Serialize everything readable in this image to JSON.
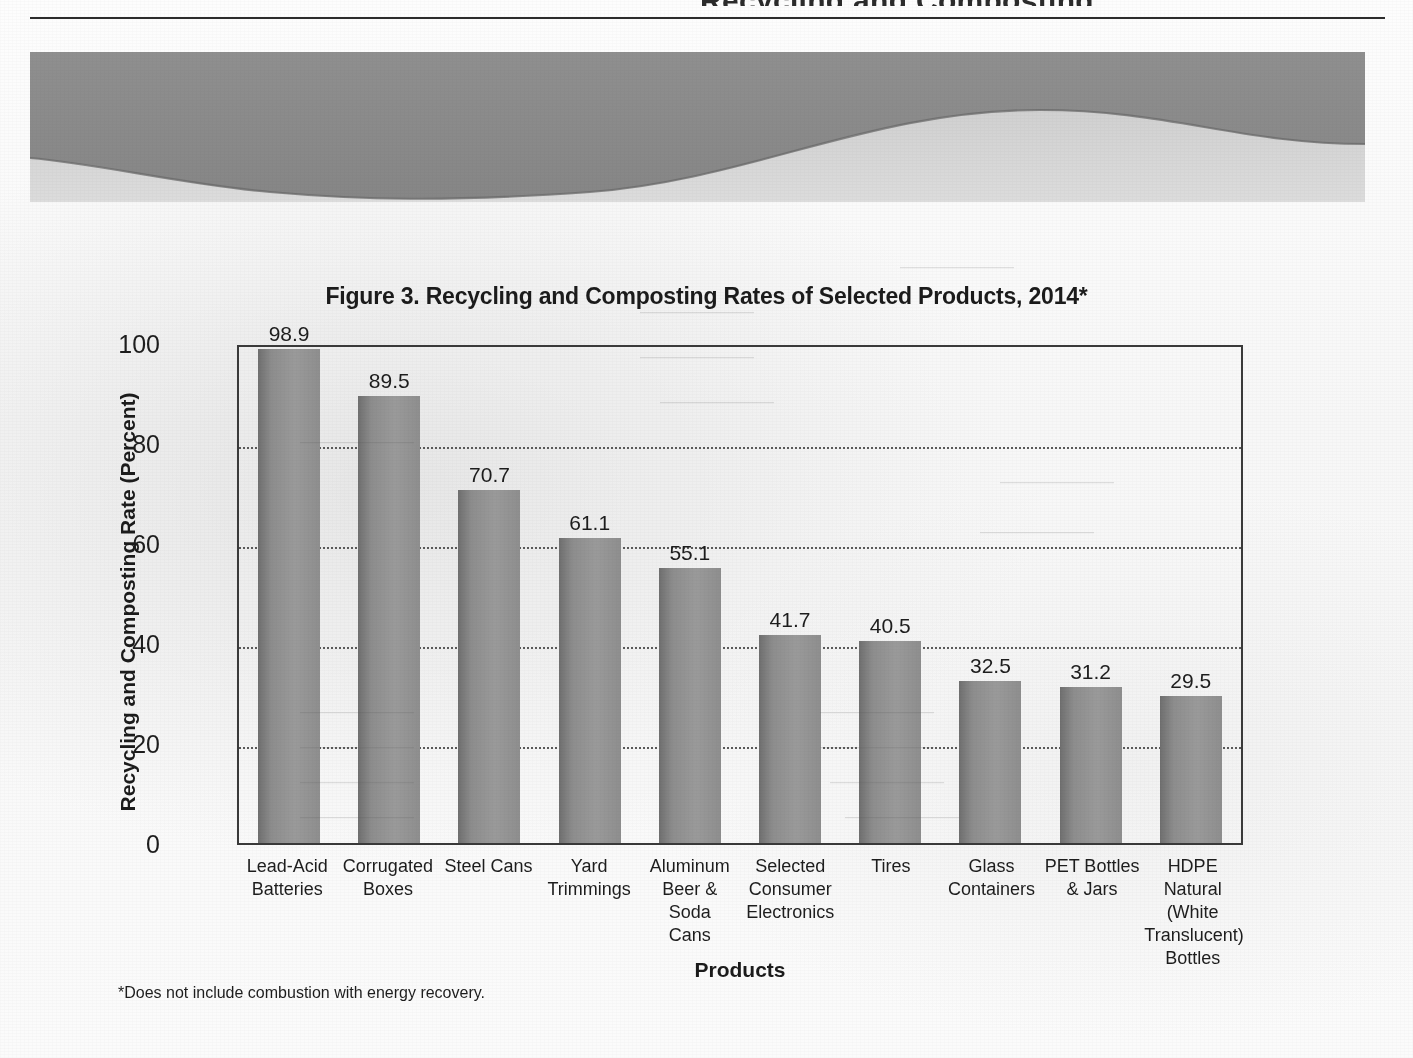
{
  "document": {
    "header_ghost_text": "Recycling and Composting",
    "footnote": "*Does not include combustion with energy recovery."
  },
  "figure": {
    "title": "Figure 3. Recycling and Composting Rates of Selected Products, 2014*",
    "x_axis_title": "Products",
    "y_axis_title": "Recycling and Composting Rate (Percent)"
  },
  "colors": {
    "bar_fill": "#8d8d8d",
    "bar_edge_dark": "#6f6f6f",
    "axis": "#3a3a3a",
    "gridline": "#5a5a5a",
    "text": "#1d1d1d",
    "wave_band": "#8c8c8c"
  },
  "chart_data": {
    "type": "bar",
    "title": "Figure 3. Recycling and Composting Rates of Selected Products, 2014*",
    "xlabel": "Products",
    "ylabel": "Recycling and Composting Rate (Percent)",
    "ylim": [
      0,
      100
    ],
    "yticks": [
      "0",
      "20",
      "40",
      "60",
      "80",
      "100"
    ],
    "ytick_values": [
      0,
      20,
      40,
      60,
      80,
      100
    ],
    "grid": "horizontal-dotted",
    "legend": "none",
    "note": "*Does not include combustion with energy recovery.",
    "categories": [
      "Lead-Acid Batteries",
      "Corrugated Boxes",
      "Steel Cans",
      "Yard Trimmings",
      "Aluminum Beer & Soda Cans",
      "Selected Consumer Electronics",
      "Tires",
      "Glass Containers",
      "PET Bottles & Jars",
      "HDPE Natural (White Translucent) Bottles"
    ],
    "category_lines": [
      [
        "Lead-Acid",
        "Batteries"
      ],
      [
        "Corrugated",
        "Boxes"
      ],
      [
        "Steel Cans"
      ],
      [
        "Yard",
        "Trimmings"
      ],
      [
        "Aluminum",
        "Beer & Soda",
        "Cans"
      ],
      [
        "Selected",
        "Consumer",
        "Electronics"
      ],
      [
        "Tires"
      ],
      [
        "Glass",
        "Containers"
      ],
      [
        "PET Bottles",
        "& Jars"
      ],
      [
        "HDPE Natural",
        "(White",
        "Translucent)",
        "Bottles"
      ]
    ],
    "values": [
      98.9,
      89.5,
      70.7,
      61.1,
      55.1,
      41.7,
      40.5,
      32.5,
      31.2,
      29.5
    ],
    "value_labels": [
      "98.9",
      "89.5",
      "70.7",
      "61.1",
      "55.1",
      "41.7",
      "40.5",
      "32.5",
      "31.2",
      "29.5"
    ]
  }
}
